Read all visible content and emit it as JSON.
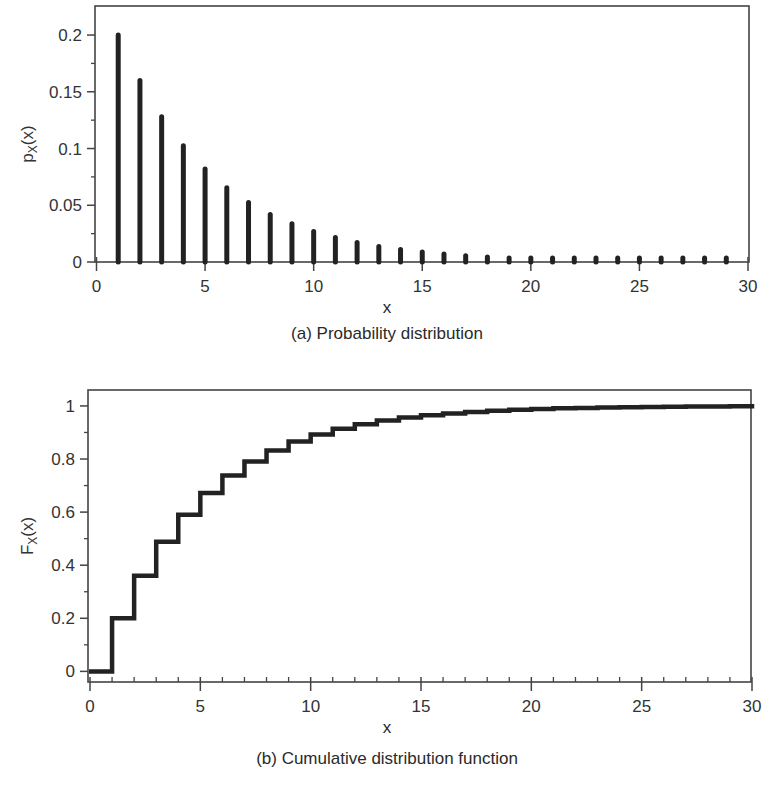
{
  "chart_data": [
    {
      "id": "pmf",
      "type": "bar",
      "subtype": "stem",
      "title": "(a) Probability distribution",
      "xlabel": "x",
      "ylabel": "p_X(x)",
      "ylabel_main": "p",
      "ylabel_sub": "X",
      "ylabel_tail": "(x)",
      "xlim": [
        0,
        30
      ],
      "ylim": [
        0,
        0.2256
      ],
      "xticks": [
        0,
        5,
        10,
        15,
        20,
        25,
        30
      ],
      "xtick_labels": [
        "0",
        "5",
        "10",
        "15",
        "20",
        "25",
        "30"
      ],
      "yticks": [
        0,
        0.05,
        0.1,
        0.15,
        0.2
      ],
      "ytick_labels": [
        "0",
        "0.05",
        "0.1",
        "0.15",
        "0.2"
      ],
      "grid": false,
      "legend": null,
      "x": [
        1,
        2,
        3,
        4,
        5,
        6,
        7,
        8,
        9,
        10,
        11,
        12,
        13,
        14,
        15,
        16,
        17,
        18,
        19,
        20,
        21,
        22,
        23,
        24,
        25,
        26,
        27,
        28,
        29
      ],
      "values": [
        0.2,
        0.16,
        0.128,
        0.1024,
        0.0819,
        0.0655,
        0.0524,
        0.0419,
        0.0336,
        0.0268,
        0.0215,
        0.0172,
        0.0137,
        0.011,
        0.0088,
        0.007,
        0.0056,
        0.0045,
        0.0036,
        0.0029,
        0.0023,
        0.0018,
        0.0015,
        0.0012,
        0.0009,
        0.0008,
        0.0006,
        0.0005,
        0.0004
      ]
    },
    {
      "id": "cdf",
      "type": "line",
      "subtype": "step",
      "title": "(b) Cumulative distribution function",
      "xlabel": "x",
      "ylabel": "F_X(x)",
      "ylabel_main": "F",
      "ylabel_sub": "X",
      "ylabel_tail": "(x)",
      "xlim": [
        0,
        30
      ],
      "ylim": [
        -0.04,
        1.06
      ],
      "xticks": [
        0,
        5,
        10,
        15,
        20,
        25,
        30
      ],
      "xtick_labels": [
        "0",
        "5",
        "10",
        "15",
        "20",
        "25",
        "30"
      ],
      "yticks": [
        0,
        0.2,
        0.4,
        0.6,
        0.8,
        1
      ],
      "ytick_labels": [
        "0",
        "0.2",
        "0.4",
        "0.6",
        "0.8",
        "1"
      ],
      "grid": false,
      "legend": null,
      "x": [
        0,
        1,
        2,
        3,
        4,
        5,
        6,
        7,
        8,
        9,
        10,
        11,
        12,
        13,
        14,
        15,
        16,
        17,
        18,
        19,
        20,
        21,
        22,
        23,
        24,
        25,
        26,
        27,
        28,
        29,
        30
      ],
      "values": [
        0,
        0.2,
        0.36,
        0.488,
        0.5904,
        0.6723,
        0.7379,
        0.7903,
        0.8322,
        0.8658,
        0.8926,
        0.9141,
        0.9313,
        0.945,
        0.956,
        0.9648,
        0.9719,
        0.9775,
        0.982,
        0.9856,
        0.9885,
        0.9908,
        0.9926,
        0.9941,
        0.9953,
        0.9962,
        0.997,
        0.9976,
        0.9981,
        0.9985,
        0.9988
      ]
    }
  ],
  "colors": {
    "ink": "#222222",
    "frame": "#444444",
    "text": "#333333",
    "background": "#ffffff"
  }
}
